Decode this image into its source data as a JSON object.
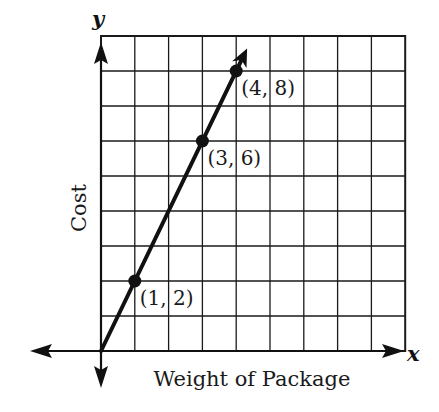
{
  "chart_data": {
    "type": "line",
    "title": "",
    "xlabel": "Weight of Package",
    "ylabel": "Cost",
    "x_axis_letter": "x",
    "y_axis_letter": "y",
    "xlim": [
      0,
      9
    ],
    "ylim": [
      0,
      9
    ],
    "grid": true,
    "grid_step": 1,
    "tick_labels_shown": false,
    "series": [
      {
        "name": "Cost vs Weight",
        "equation": "y = 2x",
        "x": [
          0,
          1,
          3,
          4
        ],
        "y": [
          0,
          2,
          6,
          8
        ],
        "arrow_at_end": true
      }
    ],
    "marked_points": [
      {
        "x": 1,
        "y": 2,
        "label": "(1, 2)"
      },
      {
        "x": 3,
        "y": 6,
        "label": "(3, 6)"
      },
      {
        "x": 4,
        "y": 8,
        "label": "(4, 8)"
      }
    ],
    "annotations": [
      "(1, 2)",
      "(3, 6)",
      "(4, 8)"
    ],
    "colors": {
      "ink": "#111111",
      "grid": "#1a1a1a",
      "background": "#ffffff"
    }
  },
  "layout": {
    "origin_px": [
      101,
      351
    ],
    "cell_w": 33.8,
    "cell_h": 35,
    "cols": 9,
    "rows": 9
  }
}
